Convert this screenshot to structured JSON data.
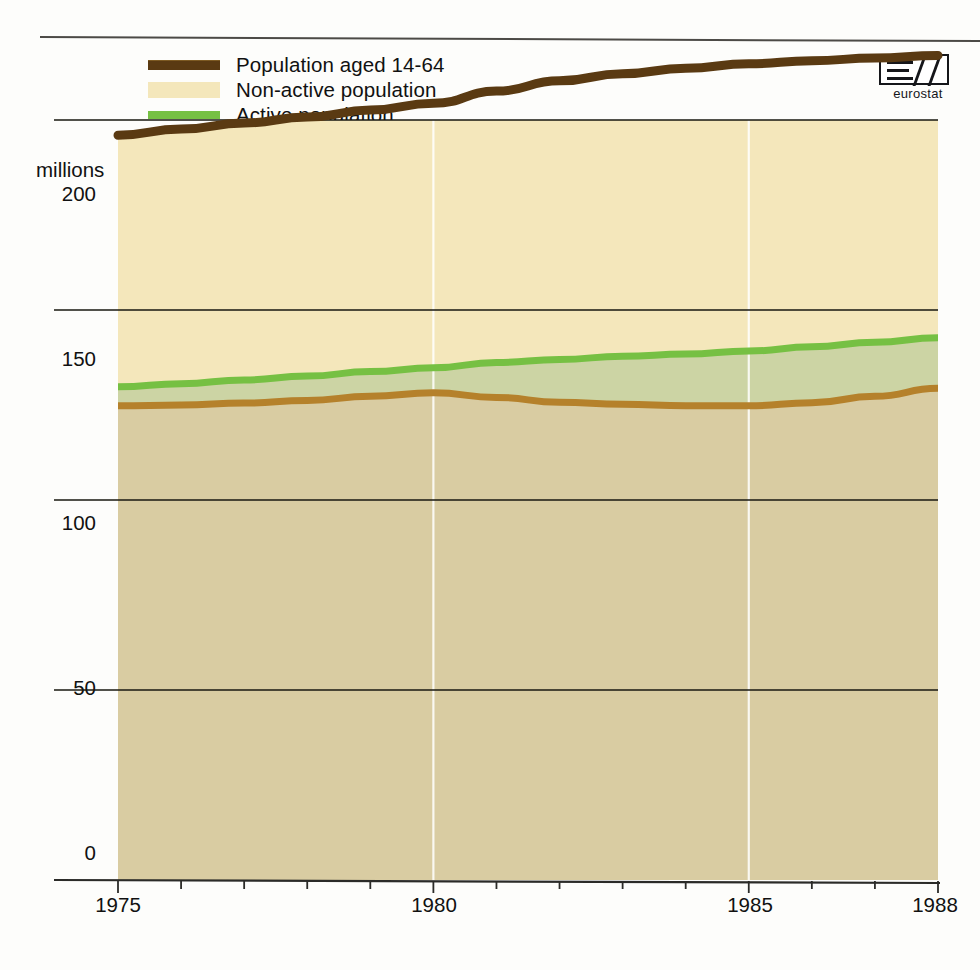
{
  "chart_data": {
    "type": "area",
    "title": "",
    "subtitle": "",
    "xlabel": "",
    "ylabel": "millions",
    "unit_label": "millions",
    "xlim": [
      1975,
      1988
    ],
    "ylim": [
      0,
      200
    ],
    "y_ticks": [
      "0",
      "50",
      "100",
      "150",
      "200"
    ],
    "y_tick_values": [
      0,
      50,
      100,
      150,
      200
    ],
    "x_ticks": [
      "1975",
      "1980",
      "1985",
      "1988"
    ],
    "x_tick_values": [
      1975,
      1980,
      1985,
      1988
    ],
    "x_minor_ticks": [
      1976,
      1977,
      1978,
      1979,
      1981,
      1982,
      1983,
      1984,
      1986,
      1987
    ],
    "grid": {
      "horizontal": true,
      "vertical": true,
      "vertical_years": [
        1980,
        1985
      ]
    },
    "legend_position": "top-left",
    "x": [
      1975,
      1976,
      1977,
      1978,
      1979,
      1980,
      1981,
      1982,
      1983,
      1984,
      1985,
      1986,
      1987,
      1988
    ],
    "series": [
      {
        "name": "Population aged 14-64",
        "kind": "line",
        "color": "#5a3a12",
        "values": [
          196.0,
          197.6,
          199.2,
          200.8,
          202.6,
          204.4,
          207.6,
          210.3,
          212.2,
          213.6,
          214.8,
          215.6,
          216.3,
          217.0
        ]
      },
      {
        "name": "Non-active population",
        "kind": "area",
        "color": "#f4e7bb",
        "description": "band between Active population line and Population aged 14-64 line",
        "values": [
          66.2,
          67.0,
          67.6,
          68.2,
          68.8,
          69.6,
          71.4,
          73.3,
          74.4,
          75.2,
          75.6,
          75.3,
          74.8,
          74.3
        ]
      },
      {
        "name": "Active population",
        "kind": "line",
        "color": "#76c043",
        "values": [
          129.8,
          130.6,
          131.6,
          132.6,
          133.8,
          134.8,
          136.2,
          137.0,
          137.8,
          138.4,
          139.2,
          140.3,
          141.5,
          142.7
        ]
      },
      {
        "name": "Unemployment",
        "kind": "area",
        "color": "#ccd4a4",
        "description": "band between Employment line and Active population line",
        "values": [
          5.0,
          5.6,
          6.1,
          6.4,
          6.5,
          6.6,
          9.2,
          11.3,
          12.6,
          13.6,
          14.4,
          14.7,
          14.2,
          13.3
        ]
      },
      {
        "name": "Employment",
        "kind": "line",
        "color": "#b5812b",
        "values": [
          124.8,
          125.0,
          125.5,
          126.2,
          127.3,
          128.2,
          127.0,
          125.7,
          125.2,
          124.8,
          124.8,
          125.6,
          127.3,
          129.4
        ]
      }
    ]
  },
  "legend": {
    "items": [
      {
        "label": "Population aged 14-64",
        "swatch": "line-dark-brown",
        "color": "#5a3a12"
      },
      {
        "label": "Non-active population",
        "swatch": "fill-cream",
        "color": "#f4e7bb"
      },
      {
        "label": "Active population",
        "swatch": "line-green",
        "color": "#76c043"
      },
      {
        "label": "Unemployment",
        "swatch": "fill-sage",
        "color": "#ccd4a4"
      },
      {
        "label": "Employment",
        "swatch": "line-brown",
        "color": "#b5812b"
      }
    ]
  },
  "logo": {
    "text": "eurostat",
    "name": "eurostat-logo"
  },
  "axes": {
    "y_unit": "millions",
    "y_labels": [
      "200",
      "150",
      "100",
      "50",
      "0"
    ],
    "x_labels": [
      "1975",
      "1980",
      "1985",
      "1988"
    ]
  },
  "colors": {
    "non_active_fill": "#f4e7bb",
    "unemployment_fill": "#ccd4a4",
    "employment_fill": "#d9cca2",
    "population_line": "#5a3a12",
    "active_line": "#76c043",
    "employment_line": "#b5812b",
    "grid": "#17170f",
    "vertical_grid": "#ffffff"
  }
}
